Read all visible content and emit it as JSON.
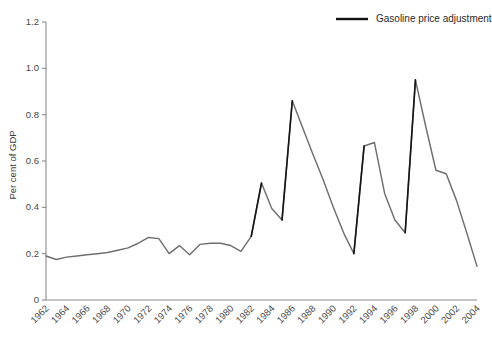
{
  "chart_data": {
    "type": "line",
    "title": "",
    "xlabel": "",
    "ylabel": "Per cent of GDP",
    "xlim": [
      1962,
      2004
    ],
    "ylim": [
      0,
      1.2
    ],
    "grid": false,
    "legend_position": "top-right",
    "ytick_labels": [
      "0",
      "0.2",
      "0.4",
      "0.6",
      "0.8",
      "1.0",
      "1.2"
    ],
    "ytick_values": [
      0,
      0.2,
      0.4,
      0.6,
      0.8,
      1.0,
      1.2
    ],
    "xtick_labels": [
      "1962",
      "1964",
      "1966",
      "1968",
      "1970",
      "1972",
      "1974",
      "1976",
      "1978",
      "1980",
      "1982",
      "1984",
      "1986",
      "1988",
      "1990",
      "1992",
      "1994",
      "1996",
      "1998",
      "2000",
      "2002",
      "2004"
    ],
    "xtick_values": [
      1962,
      1964,
      1966,
      1968,
      1970,
      1972,
      1974,
      1976,
      1978,
      1980,
      1982,
      1984,
      1986,
      1988,
      1990,
      1992,
      1994,
      1996,
      1998,
      2000,
      2002,
      2004
    ],
    "series": [
      {
        "name": "Gasoline price adjustment",
        "color": "#6f6f6f",
        "x": [
          1962,
          1963,
          1964,
          1965,
          1966,
          1967,
          1968,
          1969,
          1970,
          1971,
          1972,
          1973,
          1974,
          1975,
          1976,
          1977,
          1978,
          1979,
          1980,
          1981,
          1982,
          1983,
          1984,
          1985,
          1986,
          1987,
          1988,
          1989,
          1990,
          1991,
          1992,
          1993,
          1994,
          1995,
          1996,
          1997,
          1998,
          1999,
          2000,
          2001,
          2002,
          2003,
          2004
        ],
        "values": [
          0.19,
          0.175,
          0.185,
          0.19,
          0.195,
          0.2,
          0.205,
          0.215,
          0.225,
          0.245,
          0.27,
          0.265,
          0.2,
          0.235,
          0.195,
          0.24,
          0.245,
          0.245,
          0.235,
          0.21,
          0.275,
          0.505,
          0.395,
          0.345,
          0.86,
          0.745,
          0.63,
          0.52,
          0.4,
          0.29,
          0.2,
          0.665,
          0.68,
          0.46,
          0.345,
          0.29,
          0.95,
          0.75,
          0.56,
          0.545,
          0.43,
          0.29,
          0.145
        ]
      }
    ],
    "legend": [
      {
        "label": "Gasoline price adjustment",
        "color": "#111111"
      }
    ]
  },
  "figure": {
    "background": "#ffffff",
    "axis_color": "#8a8a8a"
  }
}
